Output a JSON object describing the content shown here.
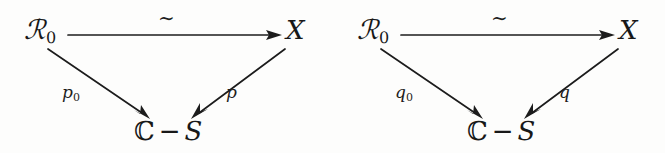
{
  "figure": {
    "background_color": "#fdfdfc",
    "ink_color": "#1c1c1c",
    "width": 665,
    "height": 153
  },
  "diagrams": [
    {
      "id": "left",
      "nodes": {
        "source": {
          "base": "ℛ",
          "subscript": "0"
        },
        "target": "X",
        "base_space": {
          "left": "ℂ",
          "operator": "−",
          "right": "S"
        }
      },
      "edges": {
        "top": {
          "label": "∼",
          "from": "source",
          "to": "target"
        },
        "left_leg": {
          "label": "p",
          "subscript": "0",
          "from": "source",
          "to": "base_space"
        },
        "right_leg": {
          "label": "p",
          "subscript": "",
          "from": "target",
          "to": "base_space"
        }
      }
    },
    {
      "id": "right",
      "nodes": {
        "source": {
          "base": "ℛ",
          "subscript": "0"
        },
        "target": "X",
        "base_space": {
          "left": "ℂ",
          "operator": "−",
          "right": "S"
        }
      },
      "edges": {
        "top": {
          "label": "∼",
          "from": "source",
          "to": "target"
        },
        "left_leg": {
          "label": "q",
          "subscript": "0",
          "from": "source",
          "to": "base_space"
        },
        "right_leg": {
          "label": "q",
          "subscript": "",
          "from": "target",
          "to": "base_space"
        }
      }
    }
  ]
}
